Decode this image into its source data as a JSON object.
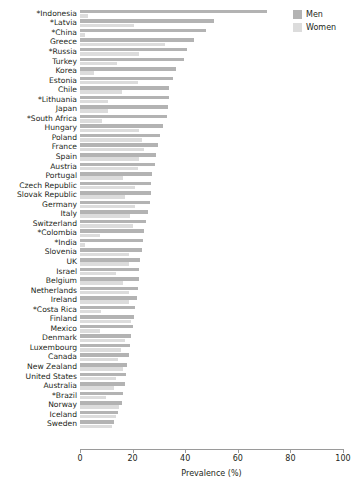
{
  "legend": {
    "position": "top-right",
    "entries": [
      {
        "label": "Men",
        "color": "#b3b3b3",
        "icon": "legend-swatch-men"
      },
      {
        "label": "Women",
        "color": "#dcdcdc",
        "icon": "legend-swatch-women"
      }
    ]
  },
  "axis": {
    "xlabel": "Prevalence (%)",
    "ticks": [
      "0",
      "20",
      "40",
      "60",
      "80",
      "100"
    ],
    "xlim": [
      0,
      100
    ]
  },
  "colors": {
    "men": "#b3b3b3",
    "women": "#dcdcdc",
    "axis": "#9a9a9a",
    "text": "#231f20",
    "background": "#ffffff"
  },
  "chart_data": {
    "type": "bar",
    "orientation": "horizontal",
    "grouping": "paired",
    "title": "",
    "subtitle": "",
    "xlabel": "Prevalence (%)",
    "ylabel": "",
    "xlim": [
      0,
      100
    ],
    "xticks": [
      0,
      20,
      40,
      60,
      80,
      100
    ],
    "grid": false,
    "legend_position": "top-right",
    "categories": [
      "*Indonesia",
      "*Latvia",
      "*China",
      "Greece",
      "*Russia",
      "Turkey",
      "Korea",
      "Estonia",
      "Chile",
      "*Lithuania",
      "Japan",
      "*South Africa",
      "Hungary",
      "Poland",
      "France",
      "Spain",
      "Austria",
      "Portugal",
      "Czech Republic",
      "Slovak Republic",
      "Germany",
      "Italy",
      "Switzerland",
      "*Colombia",
      "*India",
      "Slovenia",
      "UK",
      "Israel",
      "Belgium",
      "Netherlands",
      "Ireland",
      "*Costa Rica",
      "Finland",
      "Mexico",
      "Denmark",
      "Luxembourg",
      "Canada",
      "New Zealand",
      "United States",
      "Australia",
      "*Brazil",
      "Norway",
      "Iceland",
      "Sweden"
    ],
    "series": [
      {
        "name": "Men",
        "color": "#b3b3b3",
        "values": [
          71.0,
          51.0,
          48.0,
          43.5,
          40.5,
          39.5,
          36.5,
          35.5,
          34.0,
          34.0,
          33.5,
          33.0,
          31.5,
          30.5,
          29.5,
          29.0,
          28.5,
          27.5,
          27.0,
          27.0,
          26.5,
          26.0,
          25.0,
          24.5,
          24.0,
          23.5,
          23.0,
          22.5,
          22.5,
          22.0,
          21.5,
          21.0,
          20.5,
          20.0,
          19.5,
          19.0,
          18.5,
          18.0,
          17.5,
          17.0,
          16.5,
          16.0,
          14.5,
          13.0
        ]
      },
      {
        "name": "Women",
        "color": "#dcdcdc",
        "values": [
          3.0,
          20.5,
          2.0,
          32.5,
          22.5,
          14.0,
          5.5,
          22.0,
          16.0,
          10.5,
          10.5,
          8.5,
          22.5,
          23.5,
          24.5,
          22.5,
          22.0,
          16.5,
          21.0,
          17.0,
          21.0,
          19.0,
          20.0,
          7.5,
          2.0,
          18.5,
          18.5,
          13.5,
          16.5,
          18.5,
          18.5,
          8.0,
          19.5,
          7.5,
          17.0,
          15.5,
          14.5,
          16.5,
          13.5,
          13.0,
          10.0,
          15.0,
          13.5,
          12.0
        ]
      }
    ]
  }
}
